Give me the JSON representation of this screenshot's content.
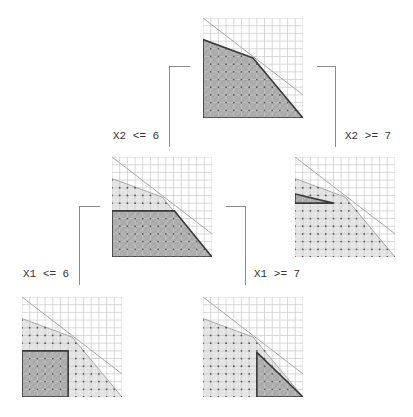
{
  "diagram": {
    "type": "branch-and-bound-tree",
    "grid_max": 13,
    "constraints": [
      {
        "name": "c1",
        "points": [
          [
            0,
            13
          ],
          [
            13,
            3
          ]
        ]
      },
      {
        "name": "c2",
        "points": [
          [
            0,
            10.2
          ],
          [
            6.5,
            7.8
          ],
          [
            13,
            0
          ]
        ]
      }
    ],
    "relaxation_polygon": [
      [
        0,
        0
      ],
      [
        0,
        10.2
      ],
      [
        6.5,
        7.8
      ],
      [
        13,
        0
      ]
    ],
    "colors": {
      "grid": "#c8c8c8",
      "constraint_line": "#a8a8a8",
      "relaxation_fill": "#e6e6e6",
      "active_fill": "#a9a9a9",
      "active_stroke": "#3a3a3a",
      "integer_point": "#555555",
      "connector": "#8a8a8a",
      "hatch": "#d9d9d9"
    },
    "nodes": [
      {
        "id": "root",
        "label": "",
        "active_region": [
          [
            0,
            0
          ],
          [
            0,
            10.2
          ],
          [
            6.5,
            7.8
          ],
          [
            13,
            0
          ]
        ]
      },
      {
        "id": "x2-le-6",
        "label": "",
        "active_region": [
          [
            0,
            0
          ],
          [
            0,
            6
          ],
          [
            8.1,
            6
          ],
          [
            13,
            0
          ]
        ]
      },
      {
        "id": "x2-ge-7",
        "label": "",
        "active_region": [
          [
            0,
            7
          ],
          [
            0,
            8.2
          ],
          [
            5,
            7
          ]
        ]
      },
      {
        "id": "x1-le-6",
        "label": "",
        "active_region": [
          [
            0,
            0
          ],
          [
            0,
            6
          ],
          [
            6,
            6
          ],
          [
            6,
            0
          ]
        ]
      },
      {
        "id": "x1-ge-7",
        "label": "",
        "active_region": [
          [
            7,
            0
          ],
          [
            7,
            5.8
          ],
          [
            13,
            0
          ]
        ]
      }
    ],
    "branches": [
      {
        "from": "root",
        "to": "x2-le-6",
        "label": "X2 <= 6"
      },
      {
        "from": "root",
        "to": "x2-ge-7",
        "label": "X2 >= 7"
      },
      {
        "from": "x2-le-6",
        "to": "x1-le-6",
        "label": "X1 <= 6"
      },
      {
        "from": "x2-le-6",
        "to": "x1-ge-7",
        "label": "X1 >= 7"
      }
    ]
  }
}
